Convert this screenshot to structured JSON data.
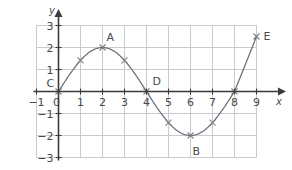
{
  "figure": {
    "background": "#ffffff",
    "grid_color": "#bfc5cc",
    "axis_color": "#3b3b3b",
    "curve_color": "#6b6f76",
    "marker_color": "#7a7f86",
    "text_color": "#4a4a4a"
  },
  "axes": {
    "x_name": "x",
    "y_name": "y",
    "x_ticks": [
      {
        "value": -1,
        "label": "−1"
      },
      {
        "value": 0,
        "label": "0"
      },
      {
        "value": 1,
        "label": "1"
      },
      {
        "value": 2,
        "label": "2"
      },
      {
        "value": 3,
        "label": "3"
      },
      {
        "value": 4,
        "label": "4"
      },
      {
        "value": 5,
        "label": "5"
      },
      {
        "value": 6,
        "label": "6"
      },
      {
        "value": 7,
        "label": "7"
      },
      {
        "value": 8,
        "label": "8"
      },
      {
        "value": 9,
        "label": "9"
      }
    ],
    "y_ticks": [
      {
        "value": 3,
        "label": "3"
      },
      {
        "value": 2,
        "label": "2"
      },
      {
        "value": 1,
        "label": "1"
      },
      {
        "value": -1,
        "label": "−1"
      },
      {
        "value": -2,
        "label": "−2"
      },
      {
        "value": -3,
        "label": "−3"
      }
    ]
  },
  "chart_data": {
    "type": "line",
    "title": "",
    "xlabel": "x",
    "ylabel": "y",
    "xlim": [
      -1,
      9
    ],
    "ylim": [
      -3,
      3
    ],
    "grid": true,
    "legend": "none",
    "series": [
      {
        "name": "y = 2 sin(πx/4)",
        "x": [
          0,
          1,
          2,
          3,
          4,
          5,
          6,
          7,
          8,
          9
        ],
        "y": [
          0,
          1.41,
          2.0,
          1.41,
          0,
          -1.41,
          -2.0,
          -1.41,
          0,
          2.5
        ],
        "marker": "x",
        "line": "solid"
      }
    ],
    "annotations": [
      {
        "label": "C",
        "x": 0,
        "y": 0,
        "dx": -12,
        "dy": -14
      },
      {
        "label": "A",
        "x": 2,
        "y": 2.0,
        "dx": 4,
        "dy": -16
      },
      {
        "label": "D",
        "x": 4,
        "y": 0,
        "dx": 6,
        "dy": -16
      },
      {
        "label": "B",
        "x": 6,
        "y": -2.0,
        "dx": 2,
        "dy": 10
      },
      {
        "label": "E",
        "x": 9,
        "y": 2.5,
        "dx": 7,
        "dy": -6
      }
    ]
  }
}
